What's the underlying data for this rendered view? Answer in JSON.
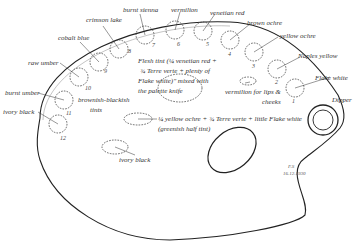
{
  "colors": {
    "ink": "#333333",
    "background": "#ffffff"
  },
  "wells": [
    {
      "num": "1",
      "label": "Flake white"
    },
    {
      "num": "2",
      "label": "Naples yellow"
    },
    {
      "num": "3",
      "label": "yellow ochre"
    },
    {
      "num": "4",
      "label": "brown ochre"
    },
    {
      "num": "5",
      "label": "venetian red"
    },
    {
      "num": "6",
      "label": "vermilion"
    },
    {
      "num": "7",
      "label": "burnt sienna"
    },
    {
      "num": "8",
      "label": "crimson lake"
    },
    {
      "num": "9",
      "label": "cobalt blue"
    },
    {
      "num": "10",
      "label": "raw umber"
    },
    {
      "num": "11",
      "label": "burnt umber"
    },
    {
      "num": "12",
      "label": "ivory black"
    }
  ],
  "mixtures": {
    "flesh_tint": [
      "Flesh tint (¼ venetian red +",
      "¾ Terre verte + plenty of",
      "Flake white)\" mixed with",
      "the palette knife"
    ],
    "lips": [
      "vermilion for lips &",
      "cheeks"
    ],
    "brownish": [
      "brownish-blackish",
      "tints"
    ],
    "greenish": [
      "¼ yellow ochre + ¾ Terre verte + little Flake white",
      "(greenish half tint)"
    ],
    "ivory_black": "ivory black"
  },
  "dipper_label": "Dipper",
  "signature": {
    "initials": "F.S",
    "date": "16.12.1930"
  }
}
